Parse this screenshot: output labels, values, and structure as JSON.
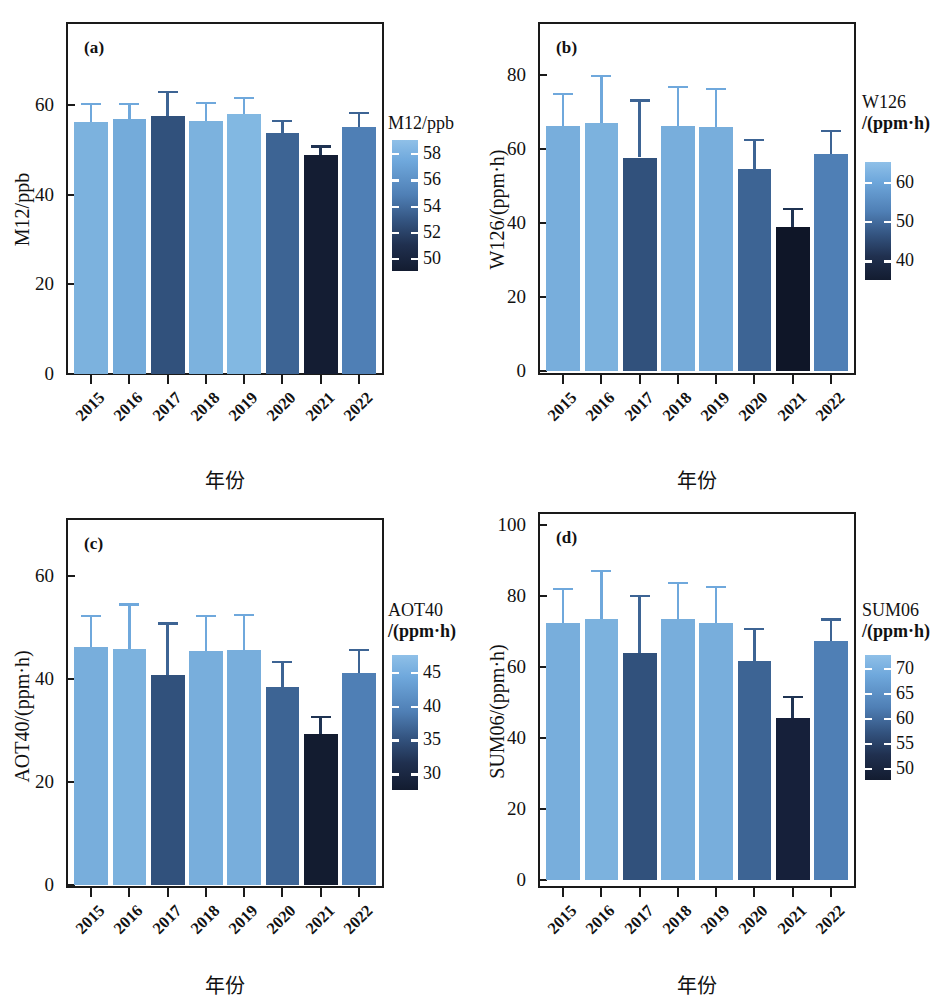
{
  "figure": {
    "xlabel": "年份",
    "categories": [
      "2015",
      "2016",
      "2017",
      "2018",
      "2019",
      "2020",
      "2021",
      "2022"
    ]
  },
  "panels": [
    {
      "tag": "(a)",
      "ylabel": "M12/ppb",
      "cbar_title_line1": "M12/ppb",
      "cbar_title_line2": "",
      "yticks": [
        "0",
        "20",
        "40",
        "60"
      ],
      "cbar_ticks": [
        "58",
        "56",
        "54",
        "52",
        "50"
      ]
    },
    {
      "tag": "(b)",
      "ylabel": "W126/(ppm·h)",
      "cbar_title_line1": "W126",
      "cbar_title_line2": "/(ppm·h)",
      "yticks": [
        "0",
        "20",
        "40",
        "60",
        "80"
      ],
      "cbar_ticks": [
        "60",
        "50",
        "40"
      ]
    },
    {
      "tag": "(c)",
      "ylabel": "AOT40/(ppm·h)",
      "cbar_title_line1": "AOT40",
      "cbar_title_line2": "/(ppm·h)",
      "yticks": [
        "0",
        "20",
        "40",
        "60"
      ],
      "cbar_ticks": [
        "45",
        "40",
        "35",
        "30"
      ]
    },
    {
      "tag": "(d)",
      "ylabel": "SUM06/(ppm·h)",
      "cbar_title_line1": "SUM06",
      "cbar_title_line2": "/(ppm·h)",
      "yticks": [
        "0",
        "20",
        "40",
        "60",
        "80",
        "100"
      ],
      "cbar_ticks": [
        "70",
        "65",
        "60",
        "55",
        "50"
      ]
    }
  ],
  "chart_data": [
    {
      "type": "bar",
      "panel": "(a)",
      "title": "M12/ppb",
      "xlabel": "年份",
      "ylabel": "M12/ppb",
      "categories": [
        "2015",
        "2016",
        "2017",
        "2018",
        "2019",
        "2020",
        "2021",
        "2022"
      ],
      "values": [
        56.3,
        56.8,
        57.5,
        56.4,
        58.0,
        53.7,
        48.8,
        55.2
      ],
      "errors": [
        4.2,
        3.7,
        5.6,
        4.3,
        3.8,
        3.0,
        2.2,
        3.2
      ],
      "colors": [
        "#7cb2de",
        "#74abda",
        "#31517c",
        "#7cb2de",
        "#82b8e2",
        "#3d6494",
        "#141d33",
        "#4f7fb5"
      ],
      "ylim": [
        0,
        72
      ],
      "yticks": [
        0,
        20,
        40,
        60
      ],
      "grid": false,
      "colorbar": {
        "label": "M12/ppb",
        "ticks": [
          58,
          56,
          54,
          52,
          50
        ],
        "vmin": 48.8,
        "vmax": 58.5
      }
    },
    {
      "type": "bar",
      "panel": "(b)",
      "title": "W126/(ppm·h)",
      "xlabel": "年份",
      "ylabel": "W126/(ppm·h)",
      "categories": [
        "2015",
        "2016",
        "2017",
        "2018",
        "2019",
        "2020",
        "2021",
        "2022"
      ],
      "values": [
        66.3,
        66.9,
        57.7,
        66.1,
        66.0,
        54.7,
        38.8,
        58.7
      ],
      "errors": [
        8.8,
        13.2,
        15.7,
        10.9,
        10.5,
        8.0,
        5.3,
        6.5
      ],
      "colors": [
        "#78aedc",
        "#7cb2de",
        "#31517c",
        "#78aedc",
        "#78aedc",
        "#3d6494",
        "#0f1628",
        "#4f7fb5"
      ],
      "ylim": [
        0,
        95
      ],
      "yticks": [
        0,
        20,
        40,
        60,
        80
      ],
      "grid": false,
      "colorbar": {
        "label": "W126/(ppm·h)",
        "ticks": [
          60,
          50,
          40
        ],
        "vmin": 38,
        "vmax": 67
      }
    },
    {
      "type": "bar",
      "panel": "(c)",
      "title": "AOT40/(ppm·h)",
      "xlabel": "年份",
      "ylabel": "AOT40/(ppm·h)",
      "categories": [
        "2015",
        "2016",
        "2017",
        "2018",
        "2019",
        "2020",
        "2021",
        "2022"
      ],
      "values": [
        46.2,
        45.8,
        40.8,
        45.5,
        45.7,
        38.5,
        29.4,
        41.2
      ],
      "errors": [
        6.3,
        8.9,
        10.2,
        7.0,
        6.9,
        5.0,
        3.4,
        4.7
      ],
      "colors": [
        "#78aedc",
        "#7cb2de",
        "#31517c",
        "#78aedc",
        "#78aedc",
        "#3d6494",
        "#131c30",
        "#4f7fb5"
      ],
      "ylim": [
        0,
        70
      ],
      "yticks": [
        0,
        20,
        40,
        60
      ],
      "grid": false,
      "colorbar": {
        "label": "AOT40/(ppm·h)",
        "ticks": [
          45,
          40,
          35,
          30
        ],
        "vmin": 29,
        "vmax": 46.5
      }
    },
    {
      "type": "bar",
      "panel": "(d)",
      "title": "SUM06/(ppm·h)",
      "xlabel": "年份",
      "ylabel": "SUM06/(ppm·h)",
      "categories": [
        "2015",
        "2016",
        "2017",
        "2018",
        "2019",
        "2020",
        "2021",
        "2022"
      ],
      "values": [
        72.5,
        73.5,
        64.0,
        73.5,
        72.3,
        61.7,
        45.6,
        67.2
      ],
      "errors": [
        9.8,
        13.8,
        16.3,
        10.5,
        10.5,
        9.3,
        6.3,
        6.5
      ],
      "colors": [
        "#78aedc",
        "#7cb2de",
        "#31517c",
        "#78aedc",
        "#78aedc",
        "#3d6494",
        "#16203a",
        "#4f7fb5"
      ],
      "ylim": [
        0,
        105
      ],
      "yticks": [
        0,
        20,
        40,
        60,
        80,
        100
      ],
      "grid": false,
      "colorbar": {
        "label": "SUM06/(ppm·h)",
        "ticks": [
          70,
          65,
          60,
          55,
          50
        ],
        "vmin": 45,
        "vmax": 74
      }
    }
  ]
}
